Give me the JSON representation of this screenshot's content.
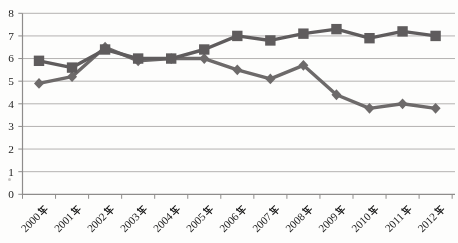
{
  "chart_data": {
    "type": "line",
    "title": "",
    "xlabel": "",
    "ylabel": "",
    "categories": [
      "2000年",
      "2001年",
      "2002年",
      "2003年",
      "2004年",
      "2005年",
      "2006年",
      "2007年",
      "2008年",
      "2009年",
      "2010年",
      "2011年",
      "2012年"
    ],
    "series": [
      {
        "name": "diamond-series",
        "marker": "diamond",
        "color": "#6d6a6a",
        "values": [
          4.9,
          5.2,
          6.5,
          5.9,
          6.0,
          6.0,
          5.5,
          5.1,
          5.7,
          4.4,
          3.8,
          4.0,
          3.8
        ]
      },
      {
        "name": "square-series",
        "marker": "square",
        "color": "#5f5c5d",
        "values": [
          5.9,
          5.6,
          6.4,
          6.0,
          6.0,
          6.4,
          7.0,
          6.8,
          7.1,
          7.3,
          6.9,
          7.2,
          7.0
        ]
      }
    ],
    "ylim": [
      0,
      8
    ],
    "yticks": [
      0,
      1,
      2,
      3,
      4,
      5,
      6,
      7,
      8
    ],
    "grid": true,
    "legend": "none",
    "grid_color": "#b4b2b1",
    "axis_color": "#8e8c8b",
    "text_color": "#1c1c1c",
    "background_color": "#fdfdfc"
  }
}
